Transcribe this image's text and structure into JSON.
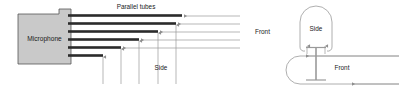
{
  "figure": {
    "background_color": "#ffffff",
    "line_color": "#9a9a9a",
    "tube_color": "#2b2b2b",
    "body_fill": "#c9c9c9",
    "body_stroke": "#555555",
    "text_color": "#1a1a1a"
  },
  "left_diagram": {
    "name": "shotgun-microphone-tube-array",
    "body_label": "Microphone",
    "tubes_label": "Parallel tubes",
    "front_label": "Front",
    "side_label": "Side",
    "tube_count": 6,
    "tube_right_ends": [
      182,
      176,
      158,
      139,
      121,
      103
    ],
    "tube_y": [
      16,
      24,
      32,
      40,
      48,
      56
    ],
    "front_ray_count": 5,
    "front_ray_x_end": 240,
    "side_ray_count": 5,
    "side_ray_x": [
      103,
      121,
      139,
      158,
      176
    ],
    "side_ray_y_end": 84
  },
  "right_diagram": {
    "name": "polar-pattern-lobe",
    "side_label": "Side",
    "front_label": "Front",
    "front_ray_count": 2,
    "side_ray_count": 2
  }
}
